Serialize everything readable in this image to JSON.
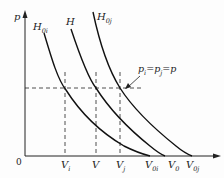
{
  "diagram": {
    "axes": {
      "y_label": "p",
      "origin_label": "0"
    },
    "curves": [
      {
        "name": "H0i",
        "base": "H",
        "sub": "0i"
      },
      {
        "name": "H",
        "base": "H",
        "sub": ""
      },
      {
        "name": "H0j",
        "base": "H",
        "sub": "0j"
      }
    ],
    "annotation": {
      "text_parts": [
        {
          "base": "p",
          "sub": "i"
        },
        {
          "op": "="
        },
        {
          "base": "p",
          "sub": "j"
        },
        {
          "op": "="
        },
        {
          "base": "p",
          "sub": ""
        }
      ]
    },
    "x_ticks": [
      {
        "base": "V",
        "sub": "i"
      },
      {
        "base": "V",
        "sub": ""
      },
      {
        "base": "V",
        "sub": "j"
      },
      {
        "base": "V",
        "sub": "0i"
      },
      {
        "base": "V",
        "sub": "0"
      },
      {
        "base": "V",
        "sub": "0j"
      }
    ]
  }
}
